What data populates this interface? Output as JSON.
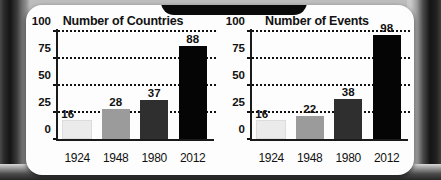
{
  "figure": {
    "background_color": "#fdfdfd",
    "bezel_color": "#1c1c1c"
  },
  "chart_data": [
    {
      "type": "bar",
      "title": "Number of Countries",
      "xlabel": "",
      "ylabel": "",
      "categories": [
        "1924",
        "1948",
        "1980",
        "2012"
      ],
      "values": [
        16,
        28,
        37,
        88
      ],
      "value_labels": [
        "16",
        "28",
        "37",
        "88"
      ],
      "bar_colors": [
        "#ebebeb",
        "#9b9b9b",
        "#2f2f2f",
        "#050505"
      ],
      "ylim": [
        0,
        100
      ],
      "yticks": [
        0,
        25,
        50,
        75,
        100
      ],
      "ytick_labels": [
        "0",
        "25",
        "50",
        "75",
        "100"
      ],
      "grid": true,
      "grid_style": "dotted",
      "legend": "none"
    },
    {
      "type": "bar",
      "title": "Number of Events",
      "xlabel": "",
      "ylabel": "",
      "categories": [
        "1924",
        "1948",
        "1980",
        "2012"
      ],
      "values": [
        16,
        22,
        38,
        98
      ],
      "value_labels": [
        "16",
        "22",
        "38",
        "98"
      ],
      "bar_colors": [
        "#ebebeb",
        "#9b9b9b",
        "#2f2f2f",
        "#050505"
      ],
      "ylim": [
        0,
        100
      ],
      "yticks": [
        0,
        25,
        50,
        75,
        100
      ],
      "ytick_labels": [
        "0",
        "25",
        "50",
        "75",
        "100"
      ],
      "grid": true,
      "grid_style": "dotted",
      "legend": "none"
    }
  ]
}
